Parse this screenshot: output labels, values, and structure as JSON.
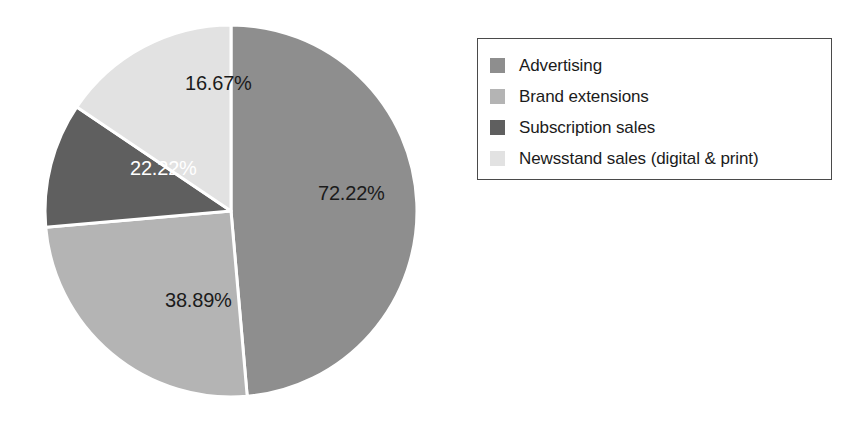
{
  "chart_data": {
    "type": "pie",
    "title": "",
    "subtitle": "",
    "xlabel": "",
    "ylabel": "",
    "legend_position": "right",
    "grid": false,
    "categories": [
      "Advertising",
      "Brand extensions",
      "Subscription sales",
      "Newsstand sales (digital & print)"
    ],
    "values": [
      72.22,
      38.89,
      22.22,
      16.67
    ],
    "value_labels": [
      "72.22%",
      "38.89%",
      "22.22%",
      "16.67%"
    ],
    "colors": [
      "#8e8e8e",
      "#b4b4b4",
      "#5f5f5f",
      "#e2e2e2"
    ],
    "label_text_colors": [
      "#1b1b1b",
      "#1b1b1b",
      "#ffffff",
      "#1b1b1b"
    ],
    "slice_start_angles_deg": [
      0,
      175,
      265,
      304
    ],
    "slice_end_angles_deg": [
      175,
      265,
      304,
      360
    ],
    "total_labeled_percent": 150.0,
    "separator_color": "#ffffff"
  },
  "pie": {
    "center_x": 193,
    "center_y": 197,
    "radius": 186,
    "slices": [
      {
        "name": "Advertising",
        "label": "72.22%",
        "color": "#8e8e8e",
        "label_color": "#1b1b1b",
        "label_x": 280,
        "label_y": 181,
        "start_deg": 0,
        "end_deg": 175
      },
      {
        "name": "Brand extensions",
        "label": "38.89%",
        "color": "#b4b4b4",
        "label_color": "#1b1b1b",
        "label_x": 127,
        "label_y": 288,
        "start_deg": 175,
        "end_deg": 265
      },
      {
        "name": "Subscription sales",
        "label": "22.22%",
        "color": "#5f5f5f",
        "label_color": "#ffffff",
        "label_x": 92,
        "label_y": 156,
        "start_deg": 265,
        "end_deg": 304
      },
      {
        "name": "Newsstand sales (digital & print)",
        "label": "16.67%",
        "color": "#e2e2e2",
        "label_color": "#1b1b1b",
        "label_x": 147,
        "label_y": 71,
        "start_deg": 304,
        "end_deg": 360
      }
    ]
  },
  "legend": {
    "border_color": "#4a4a4a",
    "background": "#ffffff",
    "items": [
      {
        "label": "Advertising",
        "color": "#8e8e8e"
      },
      {
        "label": "Brand extensions",
        "color": "#b4b4b4"
      },
      {
        "label": "Subscription sales",
        "color": "#5f5f5f"
      },
      {
        "label": "Newsstand sales (digital & print)",
        "color": "#e2e2e2"
      }
    ]
  }
}
